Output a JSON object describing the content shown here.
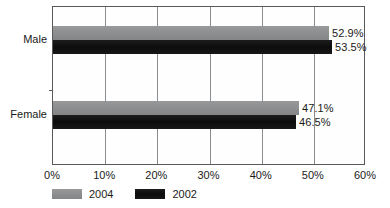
{
  "chart_data": {
    "type": "bar",
    "orientation": "horizontal",
    "title": "",
    "subtitle": "",
    "xlabel": "",
    "ylabel": "",
    "categories": [
      "Male",
      "Female"
    ],
    "series": [
      {
        "name": "2004",
        "color": "#8e9092",
        "values": [
          52.9,
          47.1
        ],
        "labels": [
          "52.9%",
          "46.5%"
        ]
      },
      {
        "name": "2002",
        "color": "#141414",
        "values": [
          53.5,
          46.5
        ],
        "labels": [
          "53.5%",
          "46.5%"
        ]
      }
    ],
    "data_labels": {
      "Male": {
        "2004": "52.9%",
        "2002": "53.5%"
      },
      "Female": {
        "2004": "47.1%",
        "2002": "46.5%"
      }
    },
    "xlim": [
      0,
      60
    ],
    "xtick_values": [
      0,
      10,
      20,
      30,
      40,
      50,
      60
    ],
    "xtick_labels": [
      "0%",
      "10%",
      "20%",
      "30%",
      "40%",
      "50%",
      "60%"
    ],
    "grid": "vertical",
    "legend_position": "bottom-left",
    "legend": [
      {
        "label": "2004",
        "color": "#8e9092"
      },
      {
        "label": "2002",
        "color": "#141414"
      }
    ],
    "frame_color": "#58595b",
    "gridline_color": "#8a8c8e"
  },
  "axis": {
    "ticks": [
      {
        "label": "0%",
        "value": 0
      },
      {
        "label": "10%",
        "value": 10
      },
      {
        "label": "20%",
        "value": 20
      },
      {
        "label": "30%",
        "value": 30
      },
      {
        "label": "40%",
        "value": 40
      },
      {
        "label": "50%",
        "value": 50
      },
      {
        "label": "60%",
        "value": 60
      }
    ]
  },
  "groups": [
    {
      "category": "Male",
      "bars": [
        {
          "series": "2004",
          "value": 52.9,
          "label": "52.9%"
        },
        {
          "series": "2002",
          "value": 53.5,
          "label": "53.5%"
        }
      ]
    },
    {
      "category": "Female",
      "bars": [
        {
          "series": "2004",
          "value": 47.1,
          "label": "47.1%"
        },
        {
          "series": "2002",
          "value": 46.5,
          "label": "46.5%"
        }
      ]
    }
  ],
  "legend": {
    "items": [
      {
        "label": "2004"
      },
      {
        "label": "2002"
      }
    ]
  }
}
